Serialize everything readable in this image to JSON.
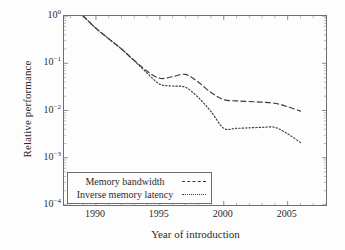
{
  "chart_data": {
    "type": "line",
    "title": "",
    "xlabel": "Year of introduction",
    "ylabel": "Relative performance",
    "xlim": [
      1987.5,
      2008
    ],
    "ylim": [
      0.0001,
      1
    ],
    "yscale": "log",
    "grid": false,
    "legend_position": "lower-left",
    "xticks": [
      1990,
      1995,
      2000,
      2005
    ],
    "xtick_labels": [
      "1990",
      "1995",
      "2000",
      "2005"
    ],
    "yticks": [
      1,
      0.1,
      0.01,
      0.001,
      0.0001
    ],
    "ytick_labels": [
      "10⁰",
      "10⁻¹",
      "10⁻²",
      "10⁻³",
      "10⁻⁴"
    ],
    "ytick_mantissa": "10",
    "ytick_exponents": [
      "0",
      "-1",
      "-2",
      "-3",
      "-4"
    ],
    "series": [
      {
        "name": "Memory bandwidth",
        "style": "dashed",
        "color": "#3a3a3a",
        "x": [
          1989,
          1990,
          1991,
          1992,
          1993,
          1994,
          1995,
          1996,
          1997,
          1998,
          1999,
          2000,
          2001,
          2002,
          2003,
          2004,
          2005,
          2006
        ],
        "y": [
          1.0,
          0.55,
          0.33,
          0.2,
          0.115,
          0.068,
          0.048,
          0.052,
          0.058,
          0.04,
          0.024,
          0.017,
          0.016,
          0.0155,
          0.015,
          0.0142,
          0.012,
          0.0097
        ]
      },
      {
        "name": "Inverse memory latency",
        "style": "dotted",
        "color": "#3a3a3a",
        "x": [
          1989,
          1990,
          1991,
          1992,
          1993,
          1994,
          1995,
          1996,
          1997,
          1998,
          1999,
          2000,
          2001,
          2002,
          2003,
          2004,
          2005,
          2006
        ],
        "y": [
          1.0,
          0.55,
          0.33,
          0.2,
          0.112,
          0.062,
          0.036,
          0.033,
          0.031,
          0.019,
          0.0095,
          0.0042,
          0.0042,
          0.0043,
          0.0044,
          0.0044,
          0.0032,
          0.0021
        ]
      }
    ]
  },
  "axes": {
    "x_title": "Year of introduction",
    "y_title": "Relative performance"
  },
  "legend": {
    "entries": [
      {
        "label": "Memory bandwidth",
        "style": "dashed"
      },
      {
        "label": "Inverse memory latency",
        "style": "dotted"
      }
    ]
  }
}
